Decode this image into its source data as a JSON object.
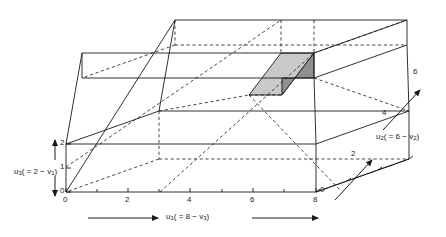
{
  "figure": {
    "title": "",
    "type": "3d-box-diagram",
    "background": "#ffffff",
    "line_color": "#1a1a1a",
    "shade_light": "#c9c9c9",
    "shade_dark": "#8f8f8f"
  },
  "axes": {
    "vertical": {
      "name": "u",
      "name_sub": "3",
      "expr_prefix": "( = 2 − v",
      "expr_sub": "1",
      "expr_suffix": ")",
      "full_label": "u3 ( = 2 − v1)",
      "ticks": [
        "0",
        "1",
        "2"
      ],
      "range": [
        0,
        2
      ],
      "arrow_style": "double-headed-vertical"
    },
    "horizontal": {
      "name": "u",
      "name_sub": "1",
      "expr_prefix": "( = 8 − v",
      "expr_sub": "3",
      "expr_suffix": ")",
      "full_label": "u1 ( = 8 − v3)",
      "ticks": [
        "0",
        "2",
        "4",
        "6",
        "8"
      ],
      "range": [
        0,
        8
      ],
      "arrow_style": "double-headed-horizontal"
    },
    "depth": {
      "name": "u",
      "name_sub": "2",
      "expr_prefix": "( = 6 − v",
      "expr_sub": "2",
      "expr_suffix": ")",
      "full_label": "u2 ( = 6 − v2)",
      "ticks": [
        "0",
        "2",
        "4",
        "6"
      ],
      "range": [
        0,
        6
      ],
      "arrow_style": "double-headed-diagonal"
    }
  },
  "tick_labels": {
    "vertical": [
      {
        "text": "2",
        "x": 66,
        "y": 140
      },
      {
        "text": "1",
        "x": 66,
        "y": 167
      },
      {
        "text": "0",
        "x": 66,
        "y": 192
      }
    ],
    "horizontal": [
      {
        "text": "0",
        "x": 68,
        "y": 197
      },
      {
        "text": "2",
        "x": 128,
        "y": 197
      },
      {
        "text": "4",
        "x": 188,
        "y": 197
      },
      {
        "text": "6",
        "x": 248,
        "y": 197
      },
      {
        "text": "8",
        "x": 307,
        "y": 197
      }
    ],
    "depth": [
      {
        "text": "0",
        "x": 322,
        "y": 192
      },
      {
        "text": "2",
        "x": 350,
        "y": 156
      },
      {
        "text": "4",
        "x": 381,
        "y": 114
      },
      {
        "text": "6",
        "x": 412,
        "y": 73
      }
    ]
  },
  "shaded_faces": [
    {
      "name": "top-face",
      "fill": "#c9c9c9"
    },
    {
      "name": "side-face",
      "fill": "#8f8f8f"
    }
  ]
}
